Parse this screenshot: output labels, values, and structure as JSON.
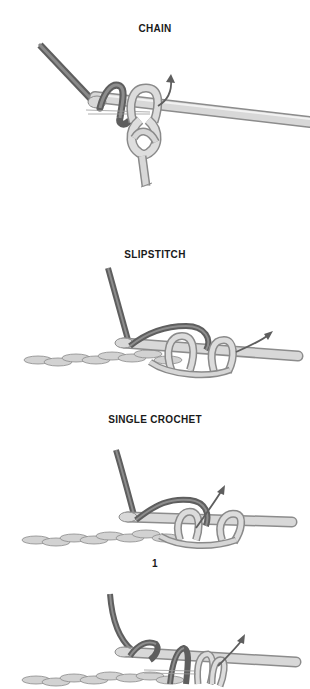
{
  "sections": [
    {
      "title": "CHAIN"
    },
    {
      "title": "SLIPSTITCH"
    },
    {
      "title": "SINGLE CROCHET",
      "step": "1"
    }
  ],
  "colors": {
    "background": "#ffffff",
    "working_yarn": "#6e6e6e",
    "working_yarn_light": "#9a9a9a",
    "hook": "#d4d4d4",
    "hook_edge": "#8c8c8c",
    "loop": "#d8d8d8",
    "loop_edge": "#8a8a8a",
    "chain": "#cfcfcf",
    "label_text": "#1a1a1a"
  },
  "illustrations": [
    {
      "name": "chain-diagram",
      "description": "Hook with slip knot, yarn wrapped over hook, arrow indicating pull-through"
    },
    {
      "name": "slipstitch-diagram",
      "description": "Foundation chain with hook inserted, yarn over, arrow indicating pull through both loops"
    },
    {
      "name": "single-crochet-step-1-diagram",
      "description": "Foundation chain with hook inserted into chain, yarn over, arrow indicating pull through"
    },
    {
      "name": "single-crochet-step-2-diagram",
      "description": "Hook with two loops and yarn over, arrow indicating pull through both loops"
    }
  ]
}
